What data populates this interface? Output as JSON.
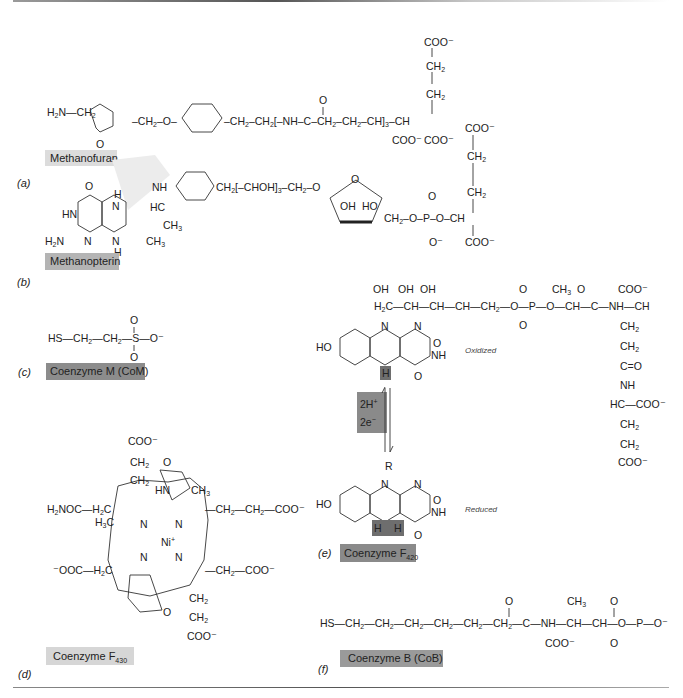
{
  "figure": {
    "panels": [
      {
        "letter": "(a)",
        "name": "Methanofuran",
        "label_bg": "#dcdcdc",
        "formula": "H2N-CH2-(furan)-CH2-O-(phenyl)-CH2-CH2-[-NH-C(=O)-CH2-CH2-CH(COO-)-]3-CH(COO-)-CH2-CH2-COO-"
      },
      {
        "letter": "(b)",
        "name": "Methanopterin",
        "label_bg": "#b4b4b4",
        "formula": "pterin-CH(CH3)-NH-(phenyl)-CH2-[-CHOH]3-CH2-O-(ribose)-CH2-O-P(=O)(O-)-O-CH(COO-)-CH2-CH2-COO-"
      },
      {
        "letter": "(c)",
        "name": "Coenzyme M (CoM)",
        "label_bg": "#8c8c8c",
        "formula": "HS-CH2-CH2-SO3-"
      },
      {
        "letter": "(d)",
        "name": "Coenzyme F",
        "subscript": "430",
        "label_bg": "#d6d6d6",
        "center_metal": "Ni+"
      },
      {
        "letter": "(e)",
        "name": "Coenzyme F",
        "subscript": "420",
        "label_bg": "#8a8a8a",
        "states": [
          "Oxidized",
          "Reduced"
        ],
        "reaction": {
          "top": "2H+",
          "bottom": "2e−"
        }
      },
      {
        "letter": "(f)",
        "name": "Coenzyme B (CoB)",
        "label_bg": "#9a9a9a",
        "formula": "HS-CH2-CH2-CH2-CH2-CH2-CH2-C(=O)-NH-CH(COO-)-CH(CH3)-O-PO3-"
      }
    ],
    "text": {
      "a_letter": "(a)",
      "a_name": "Methanofuran",
      "b_letter": "(b)",
      "b_name": "Methanopterin",
      "c_letter": "(c)",
      "c_name": "Coenzyme M (CoM)",
      "d_letter": "(d)",
      "d_name": "Coenzyme F",
      "d_sub": "430",
      "e_letter": "(e)",
      "e_name": "Coenzyme F",
      "e_sub": "420",
      "f_letter": "(f)",
      "f_name": "Coenzyme B (CoB)",
      "oxidized": "Oxidized",
      "reduced": "Reduced",
      "protons": "2H",
      "electrons": "2e",
      "plus": "+",
      "minus": "−",
      "nickel": "Ni"
    },
    "colors": {
      "ring_fill": "#d2d2d2",
      "line": "#333333",
      "dark_label": "#8a8a8a",
      "light_label": "#dcdcdc"
    }
  }
}
